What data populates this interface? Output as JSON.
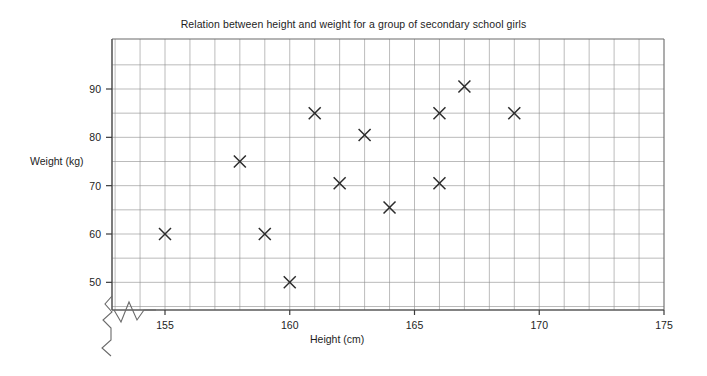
{
  "chart_data": {
    "type": "scatter",
    "title": "Relation between height and weight for a group of secondary school girls",
    "xlabel": "Height (cm)",
    "ylabel": "Weight (kg)",
    "xlim": [
      153,
      175
    ],
    "ylim": [
      45,
      95
    ],
    "x_ticks": [
      155,
      160,
      165,
      170,
      175
    ],
    "y_ticks": [
      50,
      60,
      70,
      80,
      90
    ],
    "x_tick_labels": [
      "155",
      "160",
      "165",
      "170",
      "175"
    ],
    "y_tick_labels": [
      "50",
      "60",
      "70",
      "80",
      "90"
    ],
    "x_gridline_step": 1,
    "y_gridline_step": 5,
    "grid": true,
    "legend": "none",
    "axis_break": {
      "x_axis": true,
      "y_axis": true,
      "symbol": "zigzag"
    },
    "marker": "x",
    "marker_color": "#2b2b2b",
    "points": [
      {
        "x": 155.0,
        "y": 60.0
      },
      {
        "x": 158.0,
        "y": 75.0
      },
      {
        "x": 159.0,
        "y": 60.0
      },
      {
        "x": 160.0,
        "y": 50.0
      },
      {
        "x": 161.0,
        "y": 85.0
      },
      {
        "x": 162.0,
        "y": 70.5
      },
      {
        "x": 163.0,
        "y": 80.5
      },
      {
        "x": 164.0,
        "y": 65.5
      },
      {
        "x": 166.0,
        "y": 70.5
      },
      {
        "x": 166.0,
        "y": 85.0
      },
      {
        "x": 167.0,
        "y": 90.5
      },
      {
        "x": 169.0,
        "y": 85.0
      }
    ]
  },
  "colors": {
    "background": "#ffffff",
    "grid": "#8d8d8d",
    "frame": "#6a6a6a",
    "axis": "#5a5a5a",
    "marker": "#2b2b2b",
    "text": "#1d1d1d"
  }
}
